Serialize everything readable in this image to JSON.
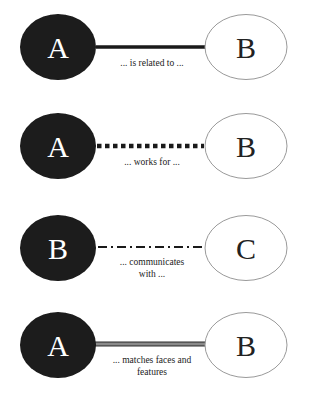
{
  "diagram": {
    "relations": [
      {
        "source": {
          "letter": "A",
          "style": "filled"
        },
        "target": {
          "letter": "B",
          "style": "outline"
        },
        "line_style": "solid-thick",
        "label_line1": "... is related to ...",
        "label_line2": ""
      },
      {
        "source": {
          "letter": "A",
          "style": "filled"
        },
        "target": {
          "letter": "B",
          "style": "outline"
        },
        "line_style": "dotted-thick",
        "label_line1": "... works for ...",
        "label_line2": ""
      },
      {
        "source": {
          "letter": "B",
          "style": "filled"
        },
        "target": {
          "letter": "C",
          "style": "outline"
        },
        "line_style": "dash-dot",
        "label_line1": "... communicates",
        "label_line2": "with ..."
      },
      {
        "source": {
          "letter": "A",
          "style": "filled"
        },
        "target": {
          "letter": "B",
          "style": "outline"
        },
        "line_style": "double",
        "label_line1": "... matches faces and",
        "label_line2": "features"
      }
    ],
    "colors": {
      "filled_node": "#1a1a1a",
      "filled_text": "#ffffff",
      "outline_stroke": "#9a9a9a",
      "outline_text": "#222222",
      "line": "#1a1a1a",
      "double_line_fill": "#8a8a8a"
    }
  }
}
